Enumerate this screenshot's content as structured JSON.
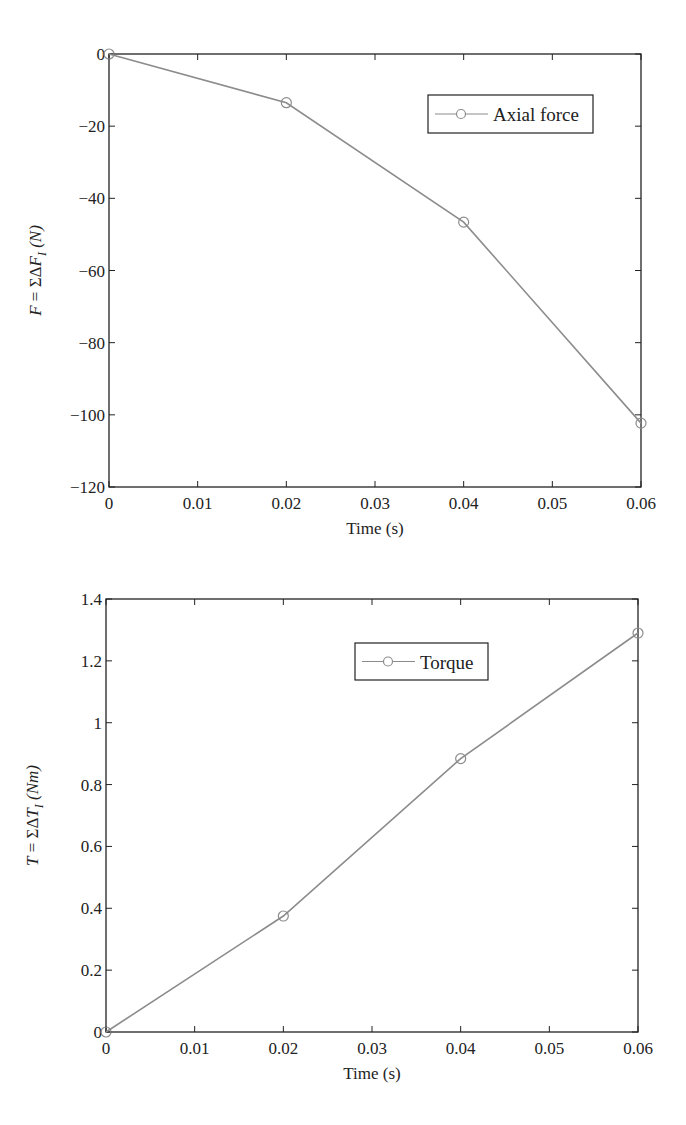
{
  "chart_data": [
    {
      "type": "line",
      "title": "",
      "xlabel": "Time (s)",
      "ylabel": "F = ΣΔF_I (N)",
      "ylabel_parts": {
        "lhs": "F",
        "eq": " = ΣΔ",
        "var": "F",
        "sub": "I",
        "unit": " (N)"
      },
      "x": [
        0,
        0.02,
        0.04,
        0.06
      ],
      "series": [
        {
          "name": "Axial force",
          "values": [
            0,
            -13.5,
            -46.6,
            -102.3
          ],
          "marker": "circle",
          "color": "#8c8c8c"
        }
      ],
      "xlim": [
        0,
        0.06
      ],
      "ylim": [
        -120,
        0
      ],
      "xticks": [
        0,
        0.01,
        0.02,
        0.03,
        0.04,
        0.05,
        0.06
      ],
      "xtick_labels": [
        "0",
        "0.01",
        "0.02",
        "0.03",
        "0.04",
        "0.05",
        "0.06"
      ],
      "yticks": [
        0,
        -20,
        -40,
        -60,
        -80,
        -100,
        -120
      ],
      "ytick_labels": [
        "0",
        "−20",
        "−40",
        "−60",
        "−80",
        "−100",
        "−120"
      ],
      "grid": false,
      "legend_position": "upper right",
      "layout": {
        "left": 109,
        "top": 54,
        "right": 641,
        "bottom": 487,
        "legend": {
          "x": 428,
          "y": 95,
          "w": 165,
          "h": 38
        }
      }
    },
    {
      "type": "line",
      "title": "",
      "xlabel": "Time (s)",
      "ylabel": "T = ΣΔT_I (Nm)",
      "ylabel_parts": {
        "lhs": "T",
        "eq": " = ΣΔ",
        "var": "T",
        "sub": "I",
        "unit": " (Nm)"
      },
      "x": [
        0,
        0.02,
        0.04,
        0.06
      ],
      "series": [
        {
          "name": "Torque",
          "values": [
            0,
            0.375,
            0.884,
            1.29
          ],
          "marker": "circle",
          "color": "#8c8c8c"
        }
      ],
      "xlim": [
        0,
        0.06
      ],
      "ylim": [
        0,
        1.4
      ],
      "xticks": [
        0,
        0.01,
        0.02,
        0.03,
        0.04,
        0.05,
        0.06
      ],
      "xtick_labels": [
        "0",
        "0.01",
        "0.02",
        "0.03",
        "0.04",
        "0.05",
        "0.06"
      ],
      "yticks": [
        0,
        0.2,
        0.4,
        0.6,
        0.8,
        1,
        1.2,
        1.4
      ],
      "ytick_labels": [
        "0",
        "0.2",
        "0.4",
        "0.6",
        "0.8",
        "1",
        "1.2",
        "1.4"
      ],
      "grid": false,
      "legend_position": "upper center",
      "layout": {
        "left": 106,
        "top": 39,
        "right": 638,
        "bottom": 472,
        "legend": {
          "x": 355,
          "y": 83,
          "w": 133,
          "h": 37
        }
      }
    }
  ],
  "colors": {
    "axis": "#222222",
    "line": "#8c8c8c",
    "marker": "#8c8c8c",
    "background": "#ffffff"
  }
}
